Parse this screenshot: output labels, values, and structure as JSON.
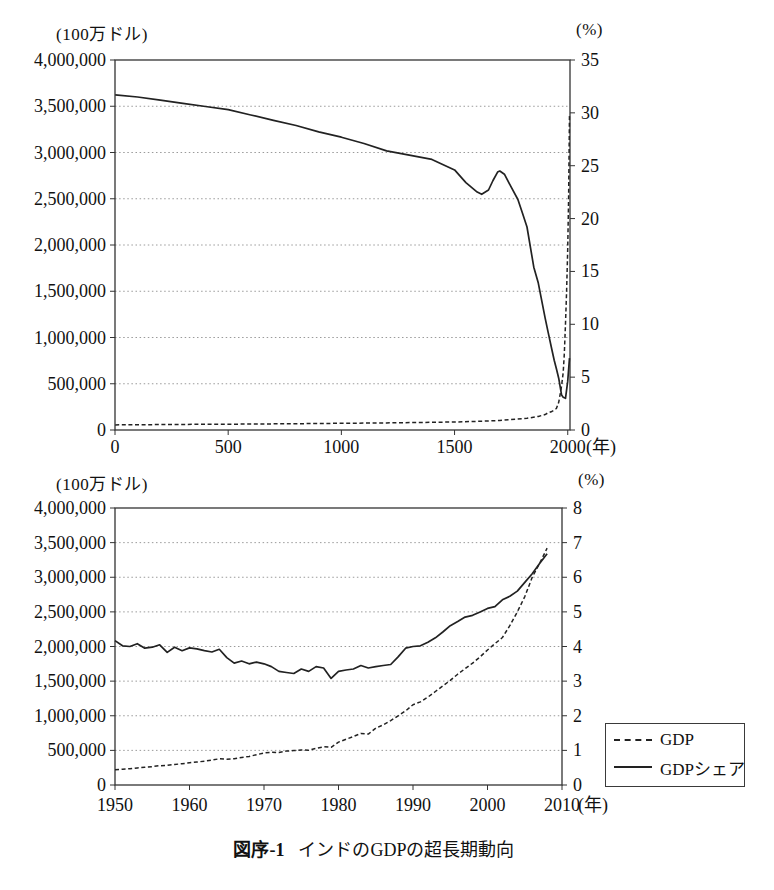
{
  "caption": {
    "number": "図序-1",
    "title": "インドのGDPの超長期動向"
  },
  "legend": {
    "entries": [
      {
        "label": "GDP",
        "style": "dashed"
      },
      {
        "label": "GDPシェア",
        "style": "solid"
      }
    ]
  },
  "colors": {
    "line": "#222222",
    "grid": "#9a9a9a",
    "axis": "#333333",
    "text": "#111111"
  },
  "chart_data": [
    {
      "name": "india-gdp-super-long-term",
      "type": "line",
      "x_axis": {
        "unit": "(年)",
        "ticks": [
          0,
          500,
          1000,
          1500,
          2000
        ]
      },
      "left_axis": {
        "unit": "(100万ドル)",
        "min": 0,
        "max": 4000000,
        "step": 500000
      },
      "right_axis": {
        "unit": "(%)",
        "min": 0,
        "max": 35,
        "step": 5
      },
      "series": [
        {
          "name": "GDP",
          "axis": "left",
          "style": "dashed",
          "points": [
            [
              1,
              55000
            ],
            [
              300,
              60000
            ],
            [
              500,
              63000
            ],
            [
              800,
              68000
            ],
            [
              1000,
              72000
            ],
            [
              1200,
              77000
            ],
            [
              1400,
              83000
            ],
            [
              1500,
              87000
            ],
            [
              1600,
              93000
            ],
            [
              1700,
              103000
            ],
            [
              1820,
              126000
            ],
            [
              1870,
              147000
            ],
            [
              1900,
              167000
            ],
            [
              1913,
              186000
            ],
            [
              1930,
              200000
            ],
            [
              1950,
              232000
            ],
            [
              1960,
              300000
            ],
            [
              1970,
              430000
            ],
            [
              1973,
              480000
            ],
            [
              1980,
              620000
            ],
            [
              1985,
              820000
            ],
            [
              1990,
              1150000
            ],
            [
              1995,
              1500000
            ],
            [
              2000,
              1950000
            ],
            [
              2004,
              2500000
            ],
            [
              2008,
              3420000
            ]
          ]
        },
        {
          "name": "GDPシェア",
          "axis": "right",
          "style": "solid",
          "points": [
            [
              1,
              31.7
            ],
            [
              100,
              31.5
            ],
            [
              200,
              31.2
            ],
            [
              300,
              30.9
            ],
            [
              400,
              30.6
            ],
            [
              500,
              30.3
            ],
            [
              600,
              29.8
            ],
            [
              700,
              29.3
            ],
            [
              800,
              28.8
            ],
            [
              900,
              28.2
            ],
            [
              1000,
              27.7
            ],
            [
              1100,
              27.1
            ],
            [
              1200,
              26.4
            ],
            [
              1300,
              26.0
            ],
            [
              1400,
              25.6
            ],
            [
              1500,
              24.6
            ],
            [
              1550,
              23.4
            ],
            [
              1600,
              22.5
            ],
            [
              1620,
              22.3
            ],
            [
              1650,
              22.7
            ],
            [
              1670,
              23.6
            ],
            [
              1690,
              24.4
            ],
            [
              1700,
              24.5
            ],
            [
              1720,
              24.2
            ],
            [
              1750,
              23.0
            ],
            [
              1780,
              21.8
            ],
            [
              1800,
              20.5
            ],
            [
              1820,
              19.2
            ],
            [
              1850,
              15.4
            ],
            [
              1870,
              13.9
            ],
            [
              1900,
              10.6
            ],
            [
              1913,
              9.3
            ],
            [
              1930,
              7.6
            ],
            [
              1940,
              6.6
            ],
            [
              1950,
              5.8
            ],
            [
              1960,
              4.9
            ],
            [
              1973,
              3.3
            ],
            [
              1980,
              3.1
            ],
            [
              1990,
              3.0
            ],
            [
              2000,
              4.6
            ],
            [
              2008,
              6.8
            ]
          ]
        }
      ]
    },
    {
      "name": "india-gdp-1950-2008",
      "type": "line",
      "x_axis": {
        "unit": "(年)",
        "ticks": [
          1950,
          1960,
          1970,
          1980,
          1990,
          2000,
          2010
        ]
      },
      "left_axis": {
        "unit": "(100万ドル)",
        "min": 0,
        "max": 4000000,
        "step": 500000
      },
      "right_axis": {
        "unit": "(%)",
        "min": 0,
        "max": 8,
        "step": 1
      },
      "series": [
        {
          "name": "GDP",
          "axis": "left",
          "style": "dashed",
          "start_year": 1950,
          "values": [
            220000,
            228000,
            236000,
            247000,
            256000,
            266000,
            278000,
            284000,
            296000,
            307000,
            320000,
            332000,
            344000,
            360000,
            378000,
            372000,
            380000,
            398000,
            412000,
            438000,
            462000,
            474000,
            470000,
            490000,
            497000,
            505000,
            502000,
            528000,
            552000,
            545000,
            620000,
            660000,
            700000,
            745000,
            735000,
            820000,
            870000,
            930000,
            1000000,
            1070000,
            1160000,
            1200000,
            1270000,
            1350000,
            1430000,
            1510000,
            1600000,
            1680000,
            1760000,
            1850000,
            1950000,
            2040000,
            2130000,
            2300000,
            2500000,
            2720000,
            3000000,
            3200000,
            3420000
          ]
        },
        {
          "name": "GDPシェア",
          "axis": "right",
          "style": "solid",
          "start_year": 1950,
          "values": [
            4.17,
            4.02,
            4.0,
            4.08,
            3.95,
            3.98,
            4.05,
            3.83,
            3.98,
            3.88,
            3.96,
            3.93,
            3.88,
            3.84,
            3.92,
            3.68,
            3.52,
            3.58,
            3.5,
            3.55,
            3.5,
            3.42,
            3.28,
            3.25,
            3.22,
            3.35,
            3.28,
            3.42,
            3.38,
            3.08,
            3.28,
            3.32,
            3.35,
            3.45,
            3.38,
            3.42,
            3.45,
            3.48,
            3.7,
            3.95,
            4.0,
            4.02,
            4.12,
            4.25,
            4.42,
            4.6,
            4.72,
            4.85,
            4.9,
            5.0,
            5.1,
            5.15,
            5.35,
            5.45,
            5.6,
            5.85,
            6.1,
            6.4,
            6.68
          ]
        }
      ]
    }
  ]
}
